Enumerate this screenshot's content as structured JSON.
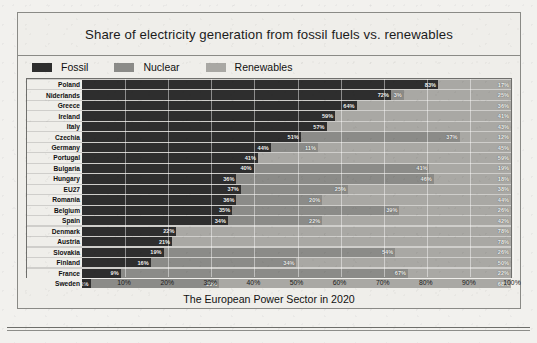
{
  "figure": {
    "title": "Share of electricity generation from fossil fuels vs. renewables",
    "caption": "The European Power Sector in 2020"
  },
  "legend": [
    {
      "label": "Fossil",
      "color": "#2e2e2e",
      "icon": "legend-swatch-fossil"
    },
    {
      "label": "Nuclear",
      "color": "#8b8b88",
      "icon": "legend-swatch-nuclear"
    },
    {
      "label": "Renewables",
      "color": "#a9a8a4",
      "icon": "legend-swatch-renewables"
    }
  ],
  "chart_data": {
    "type": "bar",
    "orientation": "horizontal",
    "stacked": true,
    "title": "Share of electricity generation from fossil fuels vs. renewables",
    "xlabel": "The European Power Sector in 2020",
    "ylabel": "",
    "xlim": [
      0,
      100
    ],
    "xticks": [
      "0%",
      "10%",
      "20%",
      "30%",
      "40%",
      "50%",
      "60%",
      "70%",
      "80%",
      "90%",
      "100%"
    ],
    "grid": true,
    "legend_position": "top-left",
    "units": "percent",
    "categories": [
      "Poland",
      "Niderlands",
      "Greece",
      "Ireland",
      "Italy",
      "Czechia",
      "Germany",
      "Portugal",
      "Bulgaria",
      "Hungary",
      "EU27",
      "Romania",
      "Belgium",
      "Spain",
      "Denmark",
      "Austria",
      "Slovakia",
      "Finland",
      "France",
      "Sweden"
    ],
    "series": [
      {
        "name": "Fossil",
        "color": "#2e2e2e",
        "values": [
          83,
          72,
          64,
          59,
          57,
          51,
          44,
          41,
          40,
          36,
          37,
          36,
          35,
          34,
          22,
          21,
          19,
          16,
          9,
          2
        ]
      },
      {
        "name": "Nuclear",
        "color": "#8b8b88",
        "values": [
          0,
          3,
          0,
          0,
          0,
          37,
          11,
          0,
          41,
          46,
          25,
          20,
          39,
          22,
          0,
          0,
          54,
          34,
          67,
          30
        ]
      },
      {
        "name": "Renewables",
        "color": "#a9a8a4",
        "values": [
          17,
          25,
          36,
          41,
          43,
          12,
          45,
          59,
          19,
          18,
          38,
          44,
          26,
          44,
          78,
          79,
          27,
          50,
          24,
          68
        ]
      }
    ],
    "rows": [
      {
        "category": "Poland",
        "fossil": 83,
        "nuclear": 0,
        "renewables": 17,
        "fossil_label": "83%",
        "nuclear_label": "",
        "renewables_label": "17%"
      },
      {
        "category": "Niderlands",
        "fossil": 72,
        "nuclear": 3,
        "renewables": 25,
        "fossil_label": "72%",
        "nuclear_label": "3%",
        "renewables_label": "25%"
      },
      {
        "category": "Greece",
        "fossil": 64,
        "nuclear": 0,
        "renewables": 36,
        "fossil_label": "64%",
        "nuclear_label": "",
        "renewables_label": "36%"
      },
      {
        "category": "Ireland",
        "fossil": 59,
        "nuclear": 0,
        "renewables": 41,
        "fossil_label": "59%",
        "nuclear_label": "",
        "renewables_label": "41%"
      },
      {
        "category": "Italy",
        "fossil": 57,
        "nuclear": 0,
        "renewables": 43,
        "fossil_label": "57%",
        "nuclear_label": "",
        "renewables_label": "43%"
      },
      {
        "category": "Czechia",
        "fossil": 51,
        "nuclear": 37,
        "renewables": 12,
        "fossil_label": "51%",
        "nuclear_label": "37%",
        "renewables_label": "12%"
      },
      {
        "category": "Germany",
        "fossil": 44,
        "nuclear": 11,
        "renewables": 45,
        "fossil_label": "44%",
        "nuclear_label": "11%",
        "renewables_label": "45%"
      },
      {
        "category": "Portugal",
        "fossil": 41,
        "nuclear": 0,
        "renewables": 59,
        "fossil_label": "41%",
        "nuclear_label": "",
        "renewables_label": "59%"
      },
      {
        "category": "Bulgaria",
        "fossil": 40,
        "nuclear": 41,
        "renewables": 19,
        "fossil_label": "40%",
        "nuclear_label": "41%",
        "renewables_label": "19%"
      },
      {
        "category": "Hungary",
        "fossil": 36,
        "nuclear": 46,
        "renewables": 18,
        "fossil_label": "36%",
        "nuclear_label": "46%",
        "renewables_label": "18%"
      },
      {
        "category": "EU27",
        "fossil": 37,
        "nuclear": 25,
        "renewables": 38,
        "fossil_label": "37%",
        "nuclear_label": "25%",
        "renewables_label": "38%"
      },
      {
        "category": "Romania",
        "fossil": 36,
        "nuclear": 20,
        "renewables": 44,
        "fossil_label": "36%",
        "nuclear_label": "20%",
        "renewables_label": "44%"
      },
      {
        "category": "Belgium",
        "fossil": 35,
        "nuclear": 39,
        "renewables": 26,
        "fossil_label": "35%",
        "nuclear_label": "39%",
        "renewables_label": "26%"
      },
      {
        "category": "Spain",
        "fossil": 34,
        "nuclear": 22,
        "renewables": 44,
        "fossil_label": "34%",
        "nuclear_label": "22%",
        "renewables_label": "42%"
      },
      {
        "category": "Denmark",
        "fossil": 22,
        "nuclear": 0,
        "renewables": 78,
        "fossil_label": "22%",
        "nuclear_label": "",
        "renewables_label": "78%"
      },
      {
        "category": "Austria",
        "fossil": 21,
        "nuclear": 0,
        "renewables": 79,
        "fossil_label": "21%",
        "nuclear_label": "",
        "renewables_label": "78%"
      },
      {
        "category": "Slovakia",
        "fossil": 19,
        "nuclear": 54,
        "renewables": 27,
        "fossil_label": "19%",
        "nuclear_label": "54%",
        "renewables_label": "26%"
      },
      {
        "category": "Finland",
        "fossil": 16,
        "nuclear": 34,
        "renewables": 50,
        "fossil_label": "16%",
        "nuclear_label": "34%",
        "renewables_label": "50%"
      },
      {
        "category": "France",
        "fossil": 9,
        "nuclear": 67,
        "renewables": 24,
        "fossil_label": "9%",
        "nuclear_label": "67%",
        "renewables_label": "22%"
      },
      {
        "category": "Sweden",
        "fossil": 2,
        "nuclear": 30,
        "renewables": 68,
        "fossil_label": "2%",
        "nuclear_label": "30%",
        "renewables_label": "68%"
      }
    ]
  }
}
